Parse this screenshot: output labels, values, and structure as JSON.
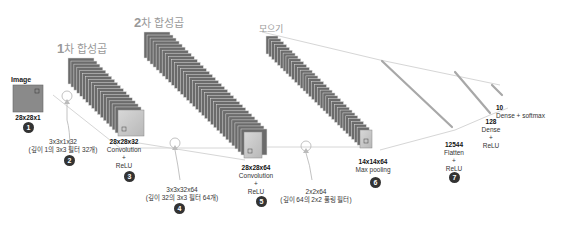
{
  "stages": {
    "conv1": {
      "num": "1",
      "text": "차 합성곱"
    },
    "conv2": {
      "num": "2",
      "text": "차 합성곱"
    },
    "pool": {
      "text": "모으기"
    }
  },
  "image": {
    "title": "Image",
    "shape": "28x28x1",
    "badge": "1"
  },
  "filter1": {
    "shape": "3x3x1x32",
    "desc": "(깊이 1의 3x3 필터 32개)",
    "badge": "2"
  },
  "conv1_out": {
    "shape": "28x28x32",
    "op": "Convolution",
    "plus": "+",
    "act": "ReLU",
    "badge": "3"
  },
  "filter2": {
    "shape": "3x3x32x64",
    "desc": "(깊이 32의 3x3 필터 64개)",
    "badge": "4"
  },
  "conv2_out": {
    "shape": "28x28x64",
    "op": "Convolution",
    "plus": "+",
    "act": "ReLU",
    "badge": "5"
  },
  "pool_filter": {
    "shape": "2x2x64",
    "desc": "(깊이 64의 2x2 풀링 필터)"
  },
  "pool_out": {
    "shape": "14x14x64",
    "op": "Max pooling",
    "badge": "6"
  },
  "flatten": {
    "size": "12544",
    "op": "Flatten",
    "plus": "+",
    "act": "ReLU",
    "badge": "7"
  },
  "dense1": {
    "size": "128",
    "op": "Dense",
    "plus": "+",
    "act": "ReLU"
  },
  "dense2": {
    "size": "10",
    "op": "Dense + softmax"
  },
  "colors": {
    "slice": "#6b6b6b",
    "slice_edge": "#3a3a3a",
    "front": "#c8c8c8",
    "line": "#cfcfcf",
    "badge": "#333333",
    "stage": "#999999"
  }
}
